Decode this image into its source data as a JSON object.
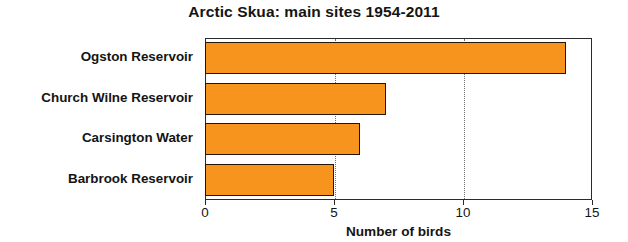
{
  "chart_data": {
    "type": "bar",
    "orientation": "horizontal",
    "title": "Arctic Skua: main sites 1954-2011",
    "xlabel": "Number of birds",
    "ylabel": "",
    "categories": [
      "Ogston Reservoir",
      "Church Wilne Reservoir",
      "Carsington Water",
      "Barbrook Reservoir"
    ],
    "values": [
      14,
      7,
      6,
      5
    ],
    "xlim": [
      0,
      15
    ],
    "xticks": [
      0,
      5,
      10,
      15
    ],
    "xtick_labels": [
      "0",
      "5",
      "10",
      "15"
    ],
    "grid": "vertical-dotted-at-5-and-10",
    "legend": "none",
    "bar_color": "#f7941e",
    "bar_edge_color": "#231508",
    "axis_color": "#2b2b2b",
    "background": "#ffffff"
  },
  "axis": {
    "x_title": "Number of birds"
  }
}
